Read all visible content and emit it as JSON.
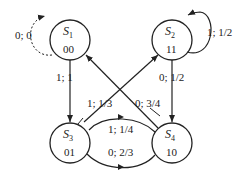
{
  "diagram": {
    "type": "state-transition",
    "states": [
      {
        "id": "S1",
        "name": "S",
        "sub": "1",
        "code": "00"
      },
      {
        "id": "S2",
        "name": "S",
        "sub": "2",
        "code": "11"
      },
      {
        "id": "S3",
        "name": "S",
        "sub": "3",
        "code": "01"
      },
      {
        "id": "S4",
        "name": "S",
        "sub": "4",
        "code": "10"
      }
    ],
    "transitions": [
      {
        "from": "S1",
        "to": "S1",
        "label": "0; 0",
        "style": "dotted"
      },
      {
        "from": "S1",
        "to": "S3",
        "label": "1; 1",
        "style": "solid"
      },
      {
        "from": "S2",
        "to": "S2",
        "label": "1; 1/2",
        "style": "solid"
      },
      {
        "from": "S2",
        "to": "S4",
        "label": "0; 1/2",
        "style": "solid"
      },
      {
        "from": "S3",
        "to": "S2",
        "label": "1; 1/3",
        "style": "solid"
      },
      {
        "from": "S4",
        "to": "S1",
        "label": "0; 3/4",
        "style": "solid"
      },
      {
        "from": "S4",
        "to": "S3",
        "label": "1; 1/4",
        "style": "solid"
      },
      {
        "from": "S3",
        "to": "S4",
        "label": "0; 2/3",
        "style": "solid"
      }
    ]
  }
}
